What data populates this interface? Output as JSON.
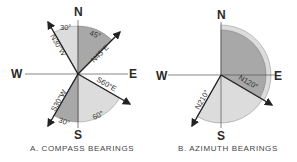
{
  "diagram_a": {
    "caption": "A. COMPASS BEARINGS",
    "cardinals": {
      "n": "N",
      "e": "E",
      "s": "S",
      "w": "W"
    },
    "bearings": [
      {
        "label": "N30°W",
        "arc_label": "30°"
      },
      {
        "label": "N45°E",
        "arc_label": "45°"
      },
      {
        "label": "S60°E",
        "arc_label": "60°"
      },
      {
        "label": "S30°W",
        "arc_label": "30°"
      }
    ]
  },
  "diagram_b": {
    "caption": "B. AZIMUTH BEARINGS",
    "cardinals": {
      "n": "N",
      "e": "E",
      "s": "S",
      "w": "W"
    },
    "bearings": [
      {
        "label": "N120°"
      },
      {
        "label": "N210°"
      }
    ]
  },
  "colors": {
    "light_fill": "#dcdcdc",
    "dark_fill": "#a8a8a8",
    "line": "#222222"
  }
}
